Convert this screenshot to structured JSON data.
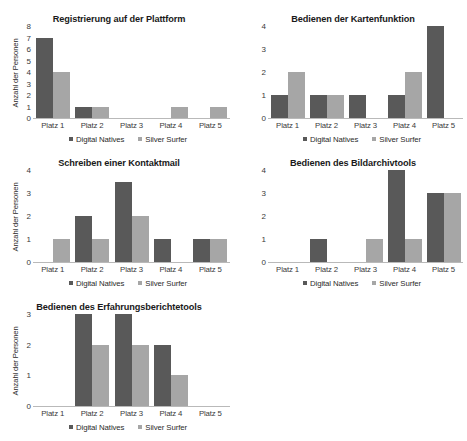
{
  "legend": {
    "series": [
      {
        "key": "dn",
        "label": "Digital Natives",
        "color": "#595959"
      },
      {
        "key": "ss",
        "label": "Silver Surfer",
        "color": "#a6a6a6"
      }
    ]
  },
  "chart_data": [
    {
      "type": "bar",
      "title": "Registrierung auf der Plattform",
      "xlabel": "",
      "ylabel": "Anzahl der Personen",
      "categories": [
        "Platz 1",
        "Platz 2",
        "Platz 3",
        "Platz 4",
        "Platz 5"
      ],
      "ylim": [
        0,
        8
      ],
      "yticks": [
        0,
        1,
        2,
        3,
        4,
        5,
        6,
        7,
        8
      ],
      "grid": false,
      "legend_position": "bottom",
      "series": [
        {
          "name": "Digital Natives",
          "values": [
            7,
            1,
            0,
            0,
            0
          ]
        },
        {
          "name": "Silver Surfer",
          "values": [
            4,
            1,
            0,
            1,
            1
          ]
        }
      ]
    },
    {
      "type": "bar",
      "title": "Bedienen der Kartenfunktion",
      "xlabel": "",
      "ylabel": "",
      "categories": [
        "Platz 1",
        "Platz 2",
        "Platz 3",
        "Platz 4",
        "Platz 5"
      ],
      "ylim": [
        0,
        4
      ],
      "yticks": [
        0,
        1,
        2,
        3,
        4
      ],
      "grid": false,
      "legend_position": "bottom",
      "series": [
        {
          "name": "Digital Natives",
          "values": [
            1,
            1,
            1,
            1,
            4
          ]
        },
        {
          "name": "Silver Surfer",
          "values": [
            2,
            1,
            0,
            2,
            0
          ]
        }
      ]
    },
    {
      "type": "bar",
      "title": "Schreiben einer Kontaktmail",
      "xlabel": "",
      "ylabel": "Anzahl der Personen",
      "categories": [
        "Platz 1",
        "Platz 2",
        "Platz 3",
        "Platz 4",
        "Platz 5"
      ],
      "ylim": [
        0,
        4
      ],
      "yticks": [
        0,
        1,
        2,
        3,
        4
      ],
      "grid": false,
      "legend_position": "bottom",
      "series": [
        {
          "name": "Digital Natives",
          "values": [
            0,
            2,
            3.5,
            1,
            1
          ]
        },
        {
          "name": "Silver Surfer",
          "values": [
            1,
            1,
            2,
            0,
            1
          ]
        }
      ]
    },
    {
      "type": "bar",
      "title": "Bedienen des Bildarchivtools",
      "xlabel": "",
      "ylabel": "",
      "categories": [
        "Platz 1",
        "Platz 2",
        "Platz 3",
        "Platz 4",
        "Platz 5"
      ],
      "ylim": [
        0,
        4
      ],
      "yticks": [
        0,
        1,
        2,
        3,
        4
      ],
      "grid": false,
      "legend_position": "bottom",
      "series": [
        {
          "name": "Digital Natives",
          "values": [
            0,
            1,
            0,
            4,
            3
          ]
        },
        {
          "name": "Silver Surfer",
          "values": [
            0,
            0,
            1,
            1,
            3
          ]
        }
      ]
    },
    {
      "type": "bar",
      "title": "Bedienen des Erfahrungsberichtetools",
      "xlabel": "",
      "ylabel": "Anzahl der Personen",
      "categories": [
        "Platz 1",
        "Platz 2",
        "Platz 3",
        "Platz 4",
        "Platz 5"
      ],
      "ylim": [
        0,
        3
      ],
      "yticks": [
        0,
        1,
        2,
        3
      ],
      "grid": false,
      "legend_position": "bottom",
      "series": [
        {
          "name": "Digital Natives",
          "values": [
            0,
            3,
            3,
            2,
            0
          ]
        },
        {
          "name": "Silver Surfer",
          "values": [
            0,
            2,
            2,
            1,
            0
          ]
        }
      ]
    }
  ]
}
